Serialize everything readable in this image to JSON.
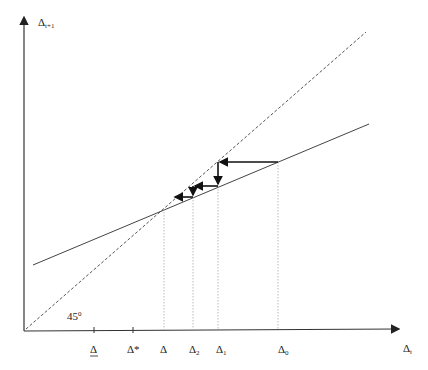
{
  "diagram": {
    "y_axis_label": "Δ",
    "y_axis_sub": "t+1",
    "x_axis_label": "Δ",
    "x_axis_sub": "t",
    "angle_label": "45",
    "angle_sup": "0",
    "ticks": [
      {
        "label": "Δ",
        "underline": true,
        "x": 94
      },
      {
        "label": "Δ*",
        "x": 133
      },
      {
        "label": "Δ",
        "x": 164
      },
      {
        "label": "Δ",
        "sub": "2",
        "x": 193
      },
      {
        "label": "Δ",
        "sub": "1",
        "x": 218
      },
      {
        "label": "Δ",
        "sub": "0",
        "x": 278
      }
    ],
    "colors": {
      "axis": "#333333",
      "line": "#444444",
      "dashed": "#555555",
      "guide": "#aaaaaa",
      "arrow": "#111111"
    }
  }
}
